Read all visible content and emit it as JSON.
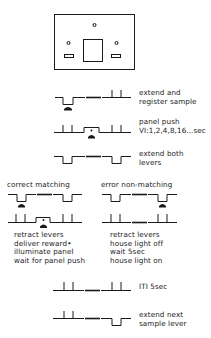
{
  "chamber": {
    "label": "operant chamber front panel"
  },
  "steps": [
    {
      "id": "extend-register",
      "lines": [
        "extend and",
        "register sample"
      ]
    },
    {
      "id": "panel-push",
      "lines": [
        "panel push",
        "VI:1,2,4,8,16...sec"
      ]
    },
    {
      "id": "extend-both",
      "lines": [
        "extend both",
        "levers"
      ]
    }
  ],
  "branches": {
    "correct": {
      "title": "correct  matching",
      "outcomes": [
        "retract  levers",
        "deliver  reward•",
        "illuminate  panel",
        "wait for panel push"
      ]
    },
    "error": {
      "title": "error  non-matching",
      "outcomes": [
        "retract  levers",
        "house light off",
        "wait  5sec",
        "house light on"
      ]
    }
  },
  "final_steps": [
    {
      "id": "iti",
      "lines": [
        "ITI  5sec"
      ]
    },
    {
      "id": "extend-next",
      "lines": [
        "extend  next",
        "sample  lever"
      ]
    }
  ],
  "colors": {
    "ink": "#1a1a1a",
    "background": "#ffffff"
  }
}
